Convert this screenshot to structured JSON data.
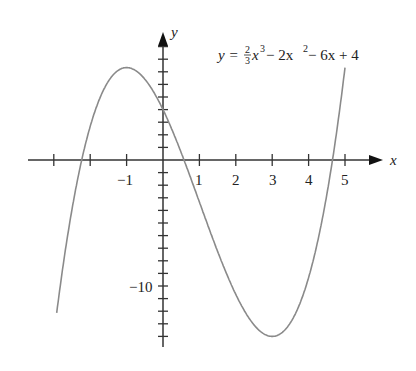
{
  "chart_data": {
    "type": "line",
    "title": "",
    "equation": {
      "lhs": "y =",
      "frac_num": "2",
      "frac_den": "3",
      "rest": "x³ − 2x² − 6x + 4"
    },
    "function": "y = (2/3)x^3 - 2x^2 - 6x + 4",
    "xlabel": "x",
    "ylabel": "y",
    "x_tick_labels": [
      "−1",
      "1",
      "2",
      "3",
      "4",
      "5"
    ],
    "x_ticks": [
      -3,
      -2,
      -1,
      1,
      2,
      3,
      4,
      5
    ],
    "y_tick_labels": [
      "−10"
    ],
    "y_ticks_step": 1,
    "xlim": [
      -3.1,
      5.1
    ],
    "ylim": [
      -15,
      7.5
    ],
    "grid": false,
    "legend": "none",
    "key_points": [
      {
        "label": "local max",
        "x": -1,
        "y": 7.33
      },
      {
        "label": "local min",
        "x": 3,
        "y": -14
      },
      {
        "label": "y-intercept",
        "x": 0,
        "y": 4
      }
    ],
    "series": [
      {
        "name": "f(x)",
        "color": "#8a8a8a",
        "x": [
          -2.9,
          -2.5,
          -2,
          -1.5,
          -1,
          -0.5,
          0,
          0.5,
          1,
          1.5,
          2,
          2.5,
          3,
          3.5,
          4,
          4.5,
          5.0
        ],
        "y": [
          -14.4,
          -4.4,
          2.67,
          6.75,
          7.33,
          6.42,
          4,
          0.58,
          -3.33,
          -7.25,
          -10.67,
          -13.08,
          -14,
          -12.92,
          -9.33,
          -2.75,
          7.33
        ]
      }
    ]
  },
  "labels": {
    "x_axis": "x",
    "y_axis": "y",
    "minus10": "−10",
    "xm1": "−1",
    "x1": "1",
    "x2": "2",
    "x3": "3",
    "x4": "4",
    "x5": "5",
    "eq_lhs": "y =",
    "eq_num": "2",
    "eq_den": "3",
    "eq_rest1": "x",
    "eq_sup3": "3",
    "eq_rest2": " − 2x",
    "eq_sup2": "2",
    "eq_rest3": " − 6x + 4"
  }
}
